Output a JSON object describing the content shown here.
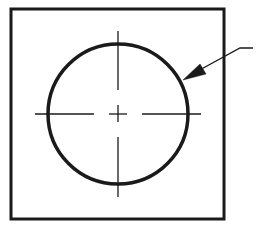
{
  "diagram": {
    "type": "technical-drawing",
    "colors": {
      "background": "#ffffff",
      "stroke": "#1a1a1a"
    },
    "square": {
      "x": 11,
      "y": 9,
      "width": 213,
      "height": 210,
      "stroke_width": 3
    },
    "circle": {
      "cx": 118,
      "cy": 114,
      "r": 70,
      "stroke_width": 3.5
    },
    "centerlines": {
      "horizontal": [
        {
          "x1": 35,
          "x2": 94,
          "y": 114
        },
        {
          "x1": 109,
          "x2": 127,
          "y": 114
        },
        {
          "x1": 142,
          "x2": 201,
          "y": 114
        }
      ],
      "vertical": [
        {
          "y1": 31,
          "y2": 90,
          "x": 118
        },
        {
          "y1": 105,
          "y2": 122,
          "x": 118
        },
        {
          "y1": 137,
          "y2": 197,
          "x": 118
        }
      ]
    },
    "leader": {
      "shoulder": {
        "x1": 253,
        "y1": 48,
        "x2": 240,
        "y2": 48
      },
      "line": {
        "x1": 240,
        "y1": 48,
        "x2": 183,
        "y2": 80
      },
      "arrowhead_tip": {
        "x": 183,
        "y": 80
      }
    }
  }
}
